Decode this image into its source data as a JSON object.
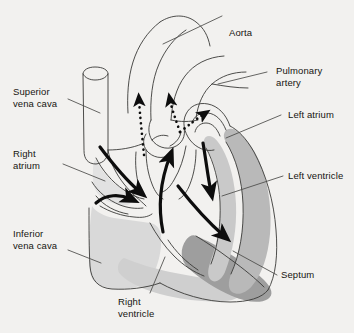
{
  "figure": {
    "kind": "anatomical-diagram",
    "background_color": "#f2f1ef",
    "ink_color": "#16150f"
  },
  "palette": {
    "outline": "#3a3a38",
    "wall_light": "#d9d9d9",
    "wall_mid": "#b9b9b9",
    "wall_dark": "#9a9a9a",
    "chamber_fill": "#fbfbfa",
    "arrow_solid": "#0d0d0d",
    "arrow_dotted": "#0d0d0d",
    "leader": "#4a4a48"
  },
  "labels": {
    "aorta": "Aorta",
    "pulmonary_artery": "Pulmonary\nartery",
    "left_atrium": "Left atrium",
    "left_ventricle": "Left ventricle",
    "septum": "Septum",
    "right_ventricle": "Right\nventricle",
    "inferior_vena_cava": "Inferior\nvena cava",
    "right_atrium": "Right\natrium",
    "superior_vena_cava": "Superior\nvena cava"
  },
  "flow_arrows": {
    "solid": [
      {
        "name": "superior-vena-cava-to-right-atrium",
        "style": "solid"
      },
      {
        "name": "inferior-vena-cava-to-right-atrium",
        "style": "solid"
      },
      {
        "name": "right-ventricle-outflow",
        "style": "solid"
      },
      {
        "name": "left-atrium-to-left-ventricle",
        "style": "solid"
      },
      {
        "name": "left-ventricle-outflow",
        "style": "solid"
      }
    ],
    "dotted": [
      {
        "name": "aortic-outflow-up",
        "style": "dotted"
      },
      {
        "name": "pulmonary-outflow-left",
        "style": "dotted"
      },
      {
        "name": "pulmonary-outflow-right",
        "style": "dotted"
      }
    ]
  }
}
